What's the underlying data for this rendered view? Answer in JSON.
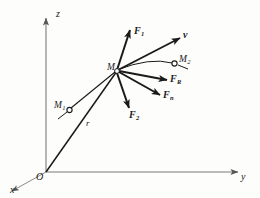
{
  "figure": {
    "type": "vector-diagram",
    "background_color": "#fdfdfc",
    "stroke_color": "#1a1a1a",
    "axes": {
      "z_label": "z",
      "y_label": "y",
      "x_label": "x",
      "origin_label": "O"
    },
    "points": {
      "particle_label": "M",
      "point1_label": "M",
      "point1_sub": "1",
      "point2_label": "M",
      "point2_sub": "2"
    },
    "vectors": [
      {
        "name": "force-1",
        "label": "F",
        "sub": "1",
        "bold": true
      },
      {
        "name": "velocity",
        "label": "v",
        "sub": "",
        "bold": true
      },
      {
        "name": "force-resultant",
        "label": "F",
        "sub": "R",
        "bold": true
      },
      {
        "name": "force-normal",
        "label": "F",
        "sub": "n",
        "bold": true
      },
      {
        "name": "force-2",
        "label": "F",
        "sub": "2",
        "bold": true
      },
      {
        "name": "position-vector",
        "label": "r",
        "sub": "",
        "bold": false
      }
    ]
  }
}
